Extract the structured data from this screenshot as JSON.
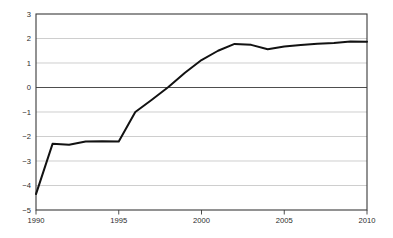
{
  "chart_data": {
    "type": "line",
    "title": "",
    "subtitle": "",
    "xlabel": "",
    "ylabel": "",
    "xlim": [
      1990,
      2010
    ],
    "ylim": [
      -5,
      3
    ],
    "grid": true,
    "legend": null,
    "x_ticks": [
      "1990",
      "1995",
      "2000",
      "2005",
      "2010"
    ],
    "x_tick_values": [
      1990,
      1995,
      2000,
      2005,
      2010
    ],
    "y_ticks": [
      "3",
      "2",
      "1",
      "0",
      "-1",
      "-2",
      "-3",
      "-4",
      "-5"
    ],
    "y_tick_values": [
      3,
      2,
      1,
      0,
      -1,
      -2,
      -3,
      -4,
      -5
    ],
    "series": [
      {
        "name": "series-1",
        "color": "#121212",
        "x": [
          1990,
          1991,
          1992,
          1993,
          1994,
          1995,
          1996,
          1997,
          1998,
          1999,
          2000,
          2001,
          2002,
          2003,
          2004,
          2005,
          2006,
          2007,
          2008,
          2009,
          2010
        ],
        "values": [
          -4.35,
          -2.3,
          -2.34,
          -2.2,
          -2.19,
          -2.2,
          -1.0,
          -0.5,
          0.02,
          0.6,
          1.12,
          1.5,
          1.78,
          1.74,
          1.56,
          1.67,
          1.73,
          1.79,
          1.82,
          1.88,
          1.87
        ]
      }
    ]
  }
}
